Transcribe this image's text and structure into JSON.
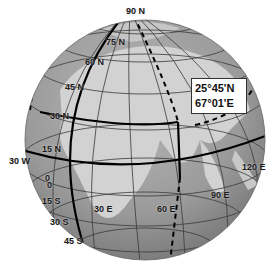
{
  "diagram": {
    "type": "globe",
    "colors": {
      "ocean": "#9a9a9a",
      "land": "#cfcfcf",
      "grid": "#3a3a3a",
      "highlight_line": "#000000",
      "background": "#ffffff"
    },
    "coordinate_box": {
      "latitude": "25°45'N",
      "longitude": "67°01'E"
    },
    "latitude_labels": [
      {
        "id": "lat-90n",
        "text": "90 N",
        "x": 126,
        "y": 7
      },
      {
        "id": "lat-75n",
        "text": "75 N",
        "x": 106,
        "y": 38
      },
      {
        "id": "lat-60n",
        "text": "60 N",
        "x": 85,
        "y": 58
      },
      {
        "id": "lat-45n",
        "text": "45 N",
        "x": 65,
        "y": 83
      },
      {
        "id": "lat-30n",
        "text": "30 N",
        "x": 50,
        "y": 112
      },
      {
        "id": "lat-15n",
        "text": "15 N",
        "x": 42,
        "y": 145
      },
      {
        "id": "lat-0a",
        "text": "0",
        "x": 45,
        "y": 174
      },
      {
        "id": "lat-0b",
        "text": "0",
        "x": 47,
        "y": 181
      },
      {
        "id": "lat-15s",
        "text": "15 S",
        "x": 42,
        "y": 197
      },
      {
        "id": "lat-30s",
        "text": "30 S",
        "x": 50,
        "y": 218
      },
      {
        "id": "lat-45s",
        "text": "45 S",
        "x": 64,
        "y": 237
      }
    ],
    "longitude_labels": [
      {
        "id": "lon-30w",
        "text": "30 W",
        "x": 9,
        "y": 157
      },
      {
        "id": "lon-30e",
        "text": "30 E",
        "x": 94,
        "y": 205
      },
      {
        "id": "lon-60e",
        "text": "60 E",
        "x": 157,
        "y": 205
      },
      {
        "id": "lon-90e",
        "text": "90 E",
        "x": 211,
        "y": 191
      },
      {
        "id": "lon-120e",
        "text": "120 E",
        "x": 242,
        "y": 163
      }
    ]
  }
}
